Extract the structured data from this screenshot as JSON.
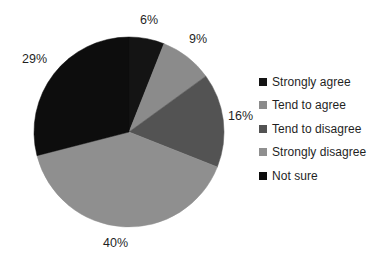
{
  "chart_data": {
    "type": "pie",
    "title": "",
    "legend_position": "right",
    "start_angle_deg": 0,
    "direction": "clockwise",
    "categories": [
      "Strongly agree",
      "Tend to agree",
      "Tend to disagree",
      "Strongly disagree",
      "Not sure"
    ],
    "values": [
      6,
      9,
      16,
      40,
      29
    ],
    "value_unit": "%",
    "data_labels": [
      "6%",
      "9%",
      "16%",
      "40%",
      "29%"
    ],
    "colors": [
      "#141414",
      "#8b8b8b",
      "#535353",
      "#8f8f8f",
      "#0d0d0d"
    ],
    "slices": [
      {
        "label": "Strongly agree",
        "value": 6,
        "data_label": "6%",
        "color": "#141414"
      },
      {
        "label": "Tend to agree",
        "value": 9,
        "data_label": "9%",
        "color": "#8b8b8b"
      },
      {
        "label": "Tend to disagree",
        "value": 16,
        "data_label": "16%",
        "color": "#535353"
      },
      {
        "label": "Strongly disagree",
        "value": 40,
        "data_label": "40%",
        "color": "#8f8f8f"
      },
      {
        "label": "Not sure",
        "value": 29,
        "data_label": "29%",
        "color": "#0d0d0d"
      }
    ]
  },
  "labels": {
    "strongly_agree_pct": "6%",
    "tend_to_agree_pct": "9%",
    "tend_to_disagree_pct": "16%",
    "strongly_disagree_pct": "40%",
    "not_sure_pct": "29%"
  },
  "legend": {
    "items": [
      {
        "label": "Strongly agree",
        "color": "#141414"
      },
      {
        "label": "Tend to agree",
        "color": "#8b8b8b"
      },
      {
        "label": "Tend to disagree",
        "color": "#535353"
      },
      {
        "label": "Strongly disagree",
        "color": "#8f8f8f"
      },
      {
        "label": "Not sure",
        "color": "#0d0d0d"
      }
    ]
  },
  "geometry": {
    "center_x": 129,
    "center_y": 132,
    "radius": 95
  }
}
